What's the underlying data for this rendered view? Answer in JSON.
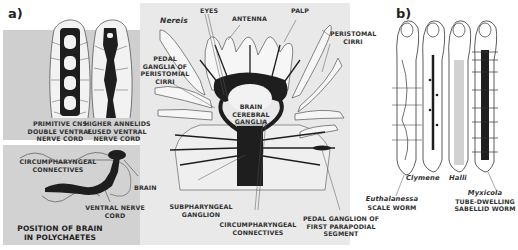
{
  "figure": {
    "panel_a": {
      "tag": "a)",
      "top_left_panel": {
        "left_caption": [
          "PRIMITIVE CNS",
          "DOUBLE VENTRAL",
          "NERVE CORD"
        ],
        "right_caption": [
          "HIGHER ANNELIDS",
          "FUSED VENTRAL",
          "NERVE CORD"
        ]
      },
      "bottom_left_panel": {
        "labels": {
          "connectives": [
            "CIRCUMPHARYNGEAL",
            "CONNECTIVES"
          ],
          "brain": "BRAIN",
          "ventral_cord": [
            "VENTRAL NERVE",
            "CORD"
          ]
        },
        "title": [
          "POSITION OF BRAIN",
          "IN POLYCHAETES"
        ]
      },
      "nereis": {
        "species": "Nereis",
        "labels": {
          "eyes": "EYES",
          "antenna": "ANTENNA",
          "palp": "PALP",
          "peristomal_cirri": [
            "PERISTOMAL",
            "CIRRI"
          ],
          "pedal_ganglia": [
            "PEDAL",
            "GANGLIA OF",
            "PERISTOMIAL",
            "CIRRI"
          ],
          "brain": [
            "BRAIN",
            "CEREBRAL",
            "GANGLIA"
          ],
          "subpharyngeal": [
            "SUBPHARYNGEAL",
            "GANGLION"
          ],
          "circum": [
            "CIRCUMPHARYNGEAL",
            "CONNECTIVES"
          ],
          "pedal_first": [
            "PEDAL GANGLION OF",
            "FIRST PARAPODIAL",
            "SEGMENT"
          ]
        }
      }
    },
    "panel_b": {
      "tag": "b)",
      "worms": [
        {
          "name": "Euthalanessa",
          "desc": "SCALE WORM"
        },
        {
          "name": "Clymene",
          "desc": ""
        },
        {
          "name": "Halli",
          "desc": ""
        },
        {
          "name": "Myxicola",
          "desc": [
            "TUBE-DWELLING",
            "SABELLID WORM"
          ]
        }
      ]
    },
    "colors": {
      "left_panel_bg": "#cfcfcf",
      "center_bg": "#e9e9e9",
      "ink": "#1e1e1e",
      "line": "#555555"
    }
  }
}
